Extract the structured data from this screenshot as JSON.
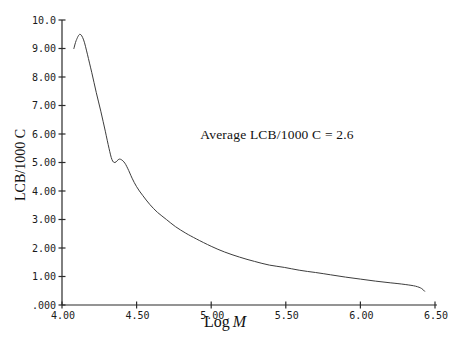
{
  "figure": {
    "background": "#ffffff"
  },
  "chart_data": {
    "type": "line",
    "title": "",
    "annotation": "Average LCB/1000 C = 2.6",
    "xlabel": "Log M",
    "xlabel_word": "Log",
    "xlabel_var": "M",
    "ylabel": "LCB/1000 C",
    "xlim": [
      4.0,
      6.5
    ],
    "ylim": [
      0.0,
      10.0
    ],
    "grid": false,
    "legend": "none",
    "x_ticks": [
      {
        "value": 4.0,
        "label": "4.00"
      },
      {
        "value": 4.5,
        "label": "4.50"
      },
      {
        "value": 5.0,
        "label": "5.00"
      },
      {
        "value": 5.5,
        "label": "5.50"
      },
      {
        "value": 6.0,
        "label": "6.00"
      },
      {
        "value": 6.5,
        "label": "6.50"
      }
    ],
    "y_ticks": [
      {
        "value": 10,
        "label": "10.0"
      },
      {
        "value": 9,
        "label": "9.00"
      },
      {
        "value": 8,
        "label": "8.00"
      },
      {
        "value": 7,
        "label": "7.00"
      },
      {
        "value": 6,
        "label": "6.00"
      },
      {
        "value": 5,
        "label": "5.00"
      },
      {
        "value": 4,
        "label": "4.00"
      },
      {
        "value": 3,
        "label": "3.00"
      },
      {
        "value": 2,
        "label": "2.00"
      },
      {
        "value": 1,
        "label": "1.00"
      },
      {
        "value": 0,
        "label": ".000"
      }
    ],
    "series": [
      {
        "name": "LCB/1000 C vs Log M",
        "x": [
          4.08,
          4.095,
          4.12,
          4.145,
          4.17,
          4.2,
          4.23,
          4.26,
          4.29,
          4.315,
          4.335,
          4.355,
          4.385,
          4.415,
          4.44,
          4.47,
          4.5,
          4.54,
          4.59,
          4.64,
          4.7,
          4.76,
          4.83,
          4.9,
          5.0,
          5.09,
          5.19,
          5.29,
          5.39,
          5.49,
          5.59,
          5.7,
          5.8,
          5.9,
          6.0,
          6.1,
          6.2,
          6.3,
          6.37,
          6.41,
          6.43
        ],
        "y": [
          9.0,
          9.28,
          9.5,
          9.3,
          8.8,
          8.15,
          7.45,
          6.8,
          6.1,
          5.5,
          5.1,
          5.0,
          5.12,
          5.02,
          4.8,
          4.45,
          4.15,
          3.85,
          3.52,
          3.25,
          3.0,
          2.75,
          2.52,
          2.32,
          2.06,
          1.86,
          1.68,
          1.53,
          1.4,
          1.32,
          1.22,
          1.14,
          1.06,
          0.98,
          0.91,
          0.84,
          0.78,
          0.72,
          0.66,
          0.58,
          0.48
        ]
      }
    ],
    "colors": {
      "curve": "#3d3d3d",
      "axis": "#2b2b2b",
      "text": "#111111",
      "background": "#ffffff"
    }
  }
}
